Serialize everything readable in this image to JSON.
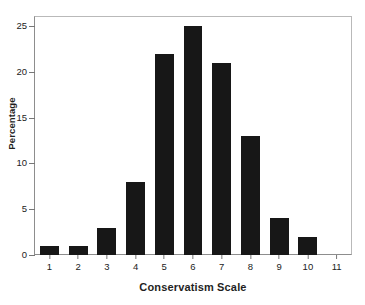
{
  "chart_data": {
    "type": "bar",
    "title": "",
    "xlabel": "Conservatism Scale",
    "ylabel": "Percentage",
    "categories": [
      "1",
      "2",
      "3",
      "4",
      "5",
      "6",
      "7",
      "8",
      "9",
      "10",
      "11"
    ],
    "values": [
      1,
      1,
      3,
      8,
      22,
      25,
      21,
      13,
      4,
      2,
      0
    ],
    "ylim": [
      0,
      26
    ],
    "yticks": [
      0,
      5,
      10,
      15,
      20,
      25
    ],
    "ytick_labels": [
      "0",
      "5",
      "10",
      "15",
      "20",
      "25"
    ],
    "grid": false,
    "legend": "none",
    "bar_color": "#171717",
    "axis_color": "#8d8d8d",
    "frame_color": "#b9b9b9",
    "text_color": "#1f1f1f"
  }
}
